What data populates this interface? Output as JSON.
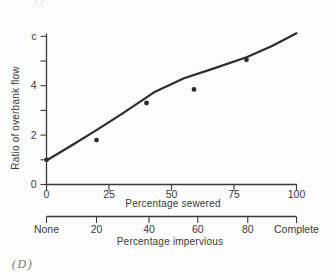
{
  "figure": {
    "panel_label": "(D)",
    "cutoff_fragment": "( )"
  },
  "chart_data": {
    "type": "scatter",
    "title": "",
    "xlabel": "Percentage sewered",
    "ylabel": "Ratio of overbank flow",
    "secondary_xlabel": "Percentage impervious",
    "xlim": [
      0,
      100
    ],
    "ylim": [
      0,
      6
    ],
    "grid": false,
    "legend": null,
    "x_ticks": [
      0,
      25,
      50,
      75,
      100
    ],
    "x_tick_labels": [
      "0",
      "25",
      "50",
      "75",
      "100"
    ],
    "y_ticks": [
      0,
      1,
      2,
      3,
      4,
      5,
      6
    ],
    "y_labeled_ticks": [
      0,
      2,
      4,
      6
    ],
    "y_tick_labels_display": [
      "0",
      "",
      "2",
      "",
      "4",
      "",
      "c"
    ],
    "secondary_x_tick_labels": [
      "None",
      "20",
      "40",
      "60",
      "80",
      "Complete"
    ],
    "secondary_x_tick_positions": [
      0,
      20,
      41,
      60.5,
      80.5,
      100
    ],
    "points": [
      {
        "x": 0,
        "y": 1.0
      },
      {
        "x": 20,
        "y": 1.8
      },
      {
        "x": 40,
        "y": 3.3
      },
      {
        "x": 59,
        "y": 3.85
      },
      {
        "x": 80,
        "y": 5.05
      }
    ],
    "trend_line": [
      {
        "x": 0,
        "y": 0.97
      },
      {
        "x": 10,
        "y": 1.58
      },
      {
        "x": 20,
        "y": 2.2
      },
      {
        "x": 30,
        "y": 2.85
      },
      {
        "x": 43,
        "y": 3.73
      },
      {
        "x": 55,
        "y": 4.3
      },
      {
        "x": 67,
        "y": 4.7
      },
      {
        "x": 80,
        "y": 5.15
      },
      {
        "x": 90,
        "y": 5.6
      },
      {
        "x": 100,
        "y": 6.12
      }
    ]
  }
}
